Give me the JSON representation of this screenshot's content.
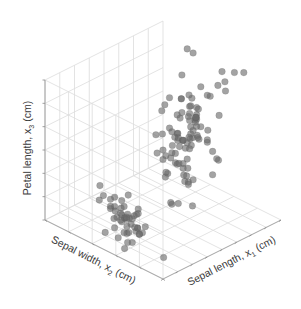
{
  "chart_data": {
    "type": "scatter",
    "projection": "3d",
    "title": "",
    "axes": {
      "x": {
        "label": "Sepal length, x",
        "subscript": "1",
        "unit": "(cm)",
        "range": [
          4,
          8
        ],
        "ticks": [
          4,
          4.5,
          5,
          5.5,
          6,
          6.5,
          7,
          7.5,
          8
        ]
      },
      "y": {
        "label": "Sepal width, x",
        "subscript": "2",
        "unit": "(cm)",
        "range": [
          2,
          4.5
        ],
        "ticks": [
          2,
          2.5,
          3,
          3.5,
          4,
          4.5
        ]
      },
      "z": {
        "label": "Petal length, x",
        "subscript": "3",
        "unit": "(cm)",
        "range": [
          1,
          7
        ],
        "ticks": [
          1,
          2,
          3,
          4,
          5,
          6,
          7
        ]
      }
    },
    "grid": true,
    "legend": "none",
    "marker_color": "#6b6b6b",
    "series": [
      {
        "name": "Iris samples",
        "points": [
          [
            5.1,
            3.5,
            1.4
          ],
          [
            4.9,
            3.0,
            1.4
          ],
          [
            4.7,
            3.2,
            1.3
          ],
          [
            4.6,
            3.1,
            1.5
          ],
          [
            5.0,
            3.6,
            1.4
          ],
          [
            5.4,
            3.9,
            1.7
          ],
          [
            4.6,
            3.4,
            1.4
          ],
          [
            5.0,
            3.4,
            1.5
          ],
          [
            4.4,
            2.9,
            1.4
          ],
          [
            4.9,
            3.1,
            1.5
          ],
          [
            5.4,
            3.7,
            1.5
          ],
          [
            4.8,
            3.4,
            1.6
          ],
          [
            4.8,
            3.0,
            1.4
          ],
          [
            4.3,
            3.0,
            1.1
          ],
          [
            5.8,
            4.0,
            1.2
          ],
          [
            5.7,
            4.4,
            1.5
          ],
          [
            5.4,
            3.9,
            1.3
          ],
          [
            5.1,
            3.5,
            1.4
          ],
          [
            5.7,
            3.8,
            1.7
          ],
          [
            5.1,
            3.8,
            1.5
          ],
          [
            5.4,
            3.4,
            1.7
          ],
          [
            5.1,
            3.7,
            1.5
          ],
          [
            4.6,
            3.6,
            1.0
          ],
          [
            5.1,
            3.3,
            1.7
          ],
          [
            4.8,
            3.4,
            1.9
          ],
          [
            5.0,
            3.0,
            1.6
          ],
          [
            5.0,
            3.4,
            1.6
          ],
          [
            5.2,
            3.5,
            1.5
          ],
          [
            5.2,
            3.4,
            1.4
          ],
          [
            4.7,
            3.2,
            1.6
          ],
          [
            4.8,
            3.1,
            1.6
          ],
          [
            5.4,
            3.4,
            1.5
          ],
          [
            5.2,
            4.1,
            1.5
          ],
          [
            5.5,
            4.2,
            1.4
          ],
          [
            4.9,
            3.1,
            1.5
          ],
          [
            5.0,
            3.2,
            1.2
          ],
          [
            5.5,
            3.5,
            1.3
          ],
          [
            4.9,
            3.6,
            1.4
          ],
          [
            4.4,
            3.0,
            1.3
          ],
          [
            5.1,
            3.4,
            1.5
          ],
          [
            5.0,
            3.5,
            1.3
          ],
          [
            4.5,
            2.3,
            1.3
          ],
          [
            4.4,
            3.2,
            1.3
          ],
          [
            5.0,
            3.5,
            1.6
          ],
          [
            5.1,
            3.8,
            1.9
          ],
          [
            4.8,
            3.0,
            1.4
          ],
          [
            5.1,
            3.8,
            1.6
          ],
          [
            4.6,
            3.2,
            1.4
          ],
          [
            5.3,
            3.7,
            1.5
          ],
          [
            5.0,
            3.3,
            1.4
          ],
          [
            7.0,
            3.2,
            4.7
          ],
          [
            6.4,
            3.2,
            4.5
          ],
          [
            6.9,
            3.1,
            4.9
          ],
          [
            5.5,
            2.3,
            4.0
          ],
          [
            6.5,
            2.8,
            4.6
          ],
          [
            5.7,
            2.8,
            4.5
          ],
          [
            6.3,
            3.3,
            4.7
          ],
          [
            4.9,
            2.4,
            3.3
          ],
          [
            6.6,
            2.9,
            4.6
          ],
          [
            5.2,
            2.7,
            3.9
          ],
          [
            5.0,
            2.0,
            3.5
          ],
          [
            5.9,
            3.0,
            4.2
          ],
          [
            6.0,
            2.2,
            4.0
          ],
          [
            6.1,
            2.9,
            4.7
          ],
          [
            5.6,
            2.9,
            3.6
          ],
          [
            6.7,
            3.1,
            4.4
          ],
          [
            5.6,
            3.0,
            4.5
          ],
          [
            5.8,
            2.7,
            4.1
          ],
          [
            6.2,
            2.2,
            4.5
          ],
          [
            5.6,
            2.5,
            3.9
          ],
          [
            5.9,
            3.2,
            4.8
          ],
          [
            6.1,
            2.8,
            4.0
          ],
          [
            6.3,
            2.5,
            4.9
          ],
          [
            6.1,
            2.8,
            4.7
          ],
          [
            6.4,
            2.9,
            4.3
          ],
          [
            6.6,
            3.0,
            4.4
          ],
          [
            6.8,
            2.8,
            4.8
          ],
          [
            6.7,
            3.0,
            5.0
          ],
          [
            6.0,
            2.9,
            4.5
          ],
          [
            5.7,
            2.6,
            3.5
          ],
          [
            5.5,
            2.4,
            3.8
          ],
          [
            5.5,
            2.4,
            3.7
          ],
          [
            5.8,
            2.7,
            3.9
          ],
          [
            6.0,
            2.7,
            5.1
          ],
          [
            5.4,
            3.0,
            4.5
          ],
          [
            6.0,
            3.4,
            4.5
          ],
          [
            6.7,
            3.1,
            4.7
          ],
          [
            6.3,
            2.3,
            4.4
          ],
          [
            5.6,
            3.0,
            4.1
          ],
          [
            5.5,
            2.5,
            4.0
          ],
          [
            5.5,
            2.6,
            4.4
          ],
          [
            6.1,
            3.0,
            4.6
          ],
          [
            5.8,
            2.6,
            4.0
          ],
          [
            5.0,
            2.3,
            3.3
          ],
          [
            5.6,
            2.7,
            4.2
          ],
          [
            5.7,
            3.0,
            4.2
          ],
          [
            5.7,
            2.9,
            4.2
          ],
          [
            6.2,
            2.9,
            4.3
          ],
          [
            5.1,
            2.5,
            3.0
          ],
          [
            5.7,
            2.8,
            4.1
          ],
          [
            6.3,
            3.3,
            6.0
          ],
          [
            5.8,
            2.7,
            5.1
          ],
          [
            7.1,
            3.0,
            5.9
          ],
          [
            6.3,
            2.9,
            5.6
          ],
          [
            6.5,
            3.0,
            5.8
          ],
          [
            7.6,
            3.0,
            6.6
          ],
          [
            4.9,
            2.5,
            4.5
          ],
          [
            7.3,
            2.9,
            6.3
          ],
          [
            6.7,
            2.5,
            5.8
          ],
          [
            7.2,
            3.6,
            6.1
          ],
          [
            6.5,
            3.2,
            5.1
          ],
          [
            6.4,
            2.7,
            5.3
          ],
          [
            6.8,
            3.0,
            5.5
          ],
          [
            5.7,
            2.5,
            5.0
          ],
          [
            5.8,
            2.8,
            5.1
          ],
          [
            6.4,
            3.2,
            5.3
          ],
          [
            6.5,
            3.0,
            5.5
          ],
          [
            7.7,
            3.8,
            6.7
          ],
          [
            7.7,
            2.6,
            6.9
          ],
          [
            6.0,
            2.2,
            5.0
          ],
          [
            6.9,
            3.2,
            5.7
          ],
          [
            5.6,
            2.8,
            4.9
          ],
          [
            7.7,
            2.8,
            6.7
          ],
          [
            6.3,
            2.7,
            4.9
          ],
          [
            6.7,
            3.3,
            5.7
          ],
          [
            7.2,
            3.2,
            6.0
          ],
          [
            6.2,
            2.8,
            4.8
          ],
          [
            6.1,
            3.0,
            4.9
          ],
          [
            6.4,
            2.8,
            5.6
          ],
          [
            7.2,
            3.0,
            5.8
          ],
          [
            7.4,
            2.8,
            6.1
          ],
          [
            7.9,
            3.8,
            6.4
          ],
          [
            6.4,
            2.8,
            5.6
          ],
          [
            6.3,
            2.8,
            5.1
          ],
          [
            6.1,
            2.6,
            5.6
          ],
          [
            7.7,
            3.0,
            6.1
          ],
          [
            6.3,
            3.4,
            5.6
          ],
          [
            6.4,
            3.1,
            5.5
          ],
          [
            6.0,
            3.0,
            4.8
          ],
          [
            6.9,
            3.1,
            5.4
          ],
          [
            6.7,
            3.1,
            5.6
          ],
          [
            6.9,
            3.1,
            5.1
          ],
          [
            5.8,
            2.7,
            5.1
          ],
          [
            6.8,
            3.2,
            5.9
          ],
          [
            6.7,
            3.3,
            5.7
          ],
          [
            6.7,
            3.0,
            5.2
          ],
          [
            6.3,
            2.5,
            5.0
          ],
          [
            6.5,
            3.0,
            5.2
          ],
          [
            6.2,
            3.4,
            5.4
          ],
          [
            5.9,
            3.0,
            5.1
          ]
        ]
      }
    ]
  }
}
